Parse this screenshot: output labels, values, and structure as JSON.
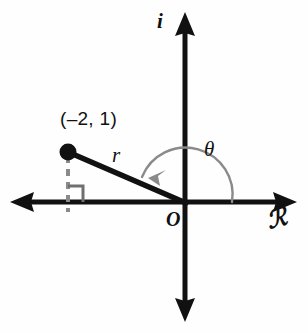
{
  "figure": {
    "kind": "complex-plane-argand-diagram",
    "background_color": "#fefefe",
    "stroke_color": "#111111",
    "dashed_color": "#8a8a8a",
    "arc_color": "#777777",
    "width": 308,
    "height": 334
  },
  "axes": {
    "imaginary_label": "i",
    "real_label": "ℛ",
    "origin_label": "O",
    "origin": {
      "x": 185,
      "y": 202
    },
    "horizontal": {
      "x1": 10,
      "x2": 297,
      "y": 202
    },
    "vertical": {
      "y1": 12,
      "y2": 322,
      "x": 185
    }
  },
  "point": {
    "label": "(–2, 1)",
    "real": -2,
    "imaginary": 1,
    "marker": {
      "x": 68,
      "y": 152,
      "radius": 8
    }
  },
  "radius": {
    "label": "r",
    "from": {
      "x": 68,
      "y": 152
    },
    "to": {
      "x": 185,
      "y": 202
    }
  },
  "angle": {
    "label": "θ",
    "arc_radius": 47,
    "start_deg": 0,
    "end_deg": 157,
    "direction": "counterclockwise"
  },
  "projection": {
    "dashed_line": {
      "x": 68,
      "y1": 155,
      "y2": 212
    },
    "right_angle_marker": {
      "x": 68,
      "y": 202,
      "size": 14
    }
  }
}
